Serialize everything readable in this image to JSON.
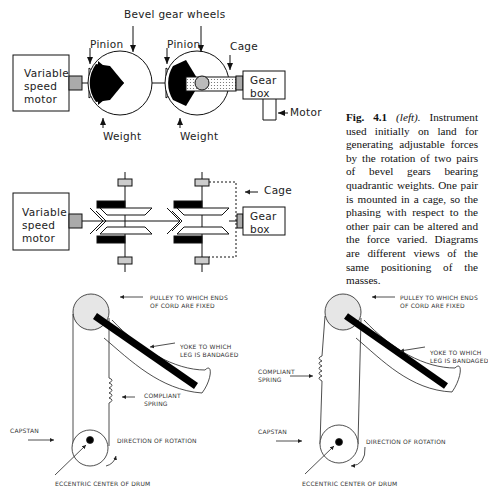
{
  "figure": {
    "number": "Fig. 4.1",
    "qualifier": "(left).",
    "caption_body": "Instrument used initially on land for generating adjustable forces by the rotation of two pairs of bevel gears bearing quadrantic weights. One pair is mounted in a cage, so the phasing with respect to the other pair can be altered and the force varied. Diagrams are different views of the same positioning of the masses."
  },
  "diagram_top": {
    "motor_label": [
      "Variable",
      "speed",
      "motor"
    ],
    "bevel_label": "Bevel gear wheels",
    "pinion_left": "Pinion",
    "pinion_right": "Pinion",
    "cage": "Cage",
    "gearbox": [
      "Gear",
      "box"
    ],
    "motor_right": "Motor",
    "weight_left": "Weight",
    "weight_right": "Weight"
  },
  "diagram_middle": {
    "motor_label": [
      "Variable",
      "speed",
      "motor"
    ],
    "cage": "Cage",
    "gearbox": [
      "Gear",
      "box"
    ]
  },
  "diagram_left_leg": {
    "pulley": [
      "PULLEY TO WHICH ENDS",
      "OF CORD ARE FIXED"
    ],
    "yoke": [
      "YOKE TO WHICH",
      "LEG IS BANDAGED"
    ],
    "spring": [
      "COMPLIANT",
      "SPRING"
    ],
    "capstan": "CAPSTAN",
    "rotation": "DIRECTION OF ROTATION",
    "eccentric": "ECCENTRIC CENTER OF DRUM"
  },
  "diagram_right_leg": {
    "pulley": [
      "PULLEY TO WHICH ENDS",
      "OF CORD ARE FIXED"
    ],
    "yoke": [
      "YOKE TO WHICH",
      "LEG IS BANDAGED"
    ],
    "spring": [
      "COMPLIANT",
      "SPRING"
    ],
    "capstan": "CAPSTAN",
    "rotation": "DIRECTION OF ROTATION",
    "eccentric": "ECCENTRIC CENTER OF DRUM"
  }
}
